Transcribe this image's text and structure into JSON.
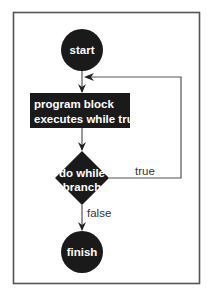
{
  "diagram": {
    "type": "flowchart",
    "title": "",
    "colors": {
      "node_fill": "#1a1a1a",
      "node_text": "#ffffff",
      "line": "#555555",
      "frame": "#555555",
      "background": "#ffffff"
    },
    "nodes": {
      "start": {
        "shape": "circle",
        "label": "start"
      },
      "block": {
        "shape": "rectangle",
        "lines": [
          "program block",
          "executes while true"
        ]
      },
      "branch": {
        "shape": "diamond",
        "lines": [
          "do while",
          "branch"
        ]
      },
      "finish": {
        "shape": "circle",
        "label": "finish"
      }
    },
    "edges": {
      "start_to_block": {
        "from": "start",
        "to": "block",
        "label": ""
      },
      "block_to_branch": {
        "from": "block",
        "to": "branch",
        "label": ""
      },
      "branch_true_loop": {
        "from": "branch",
        "to": "block",
        "label": "true"
      },
      "branch_false": {
        "from": "branch",
        "to": "finish",
        "label": "false"
      }
    }
  }
}
